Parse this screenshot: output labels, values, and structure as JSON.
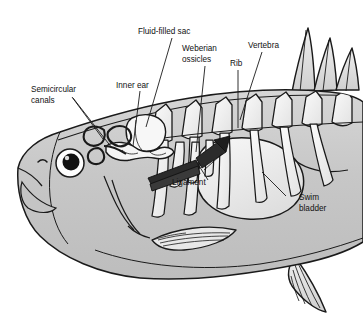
{
  "figure": {
    "background_color": "#ffffff",
    "body_fill": "#c9c9c9",
    "organ_fill": "#f2f2f2",
    "outline_color": "#1a1a1a",
    "ligament_fill": "#2b2b2b"
  },
  "labels": {
    "semicircular_canals_line1": "Semicircular",
    "semicircular_canals_line2": "canals",
    "inner_ear": "Inner ear",
    "fluid_filled_sac": "Fluid-filled sac",
    "weberian_ossicles_line1": "Weberian",
    "weberian_ossicles_line2": "ossicles",
    "rib": "Rib",
    "vertebra": "Vertebra",
    "ligament": "Ligament",
    "swim_bladder_line1": "Swim",
    "swim_bladder_line2": "bladder"
  },
  "parts": {
    "body": "fish-body",
    "eye": "eye",
    "pupil": "pupil",
    "nostril": "nostril",
    "mouth": "mouth",
    "operculum": "gill-cover",
    "pectoral_fin": "pectoral-fin",
    "pelvic_fin": "pelvic-fin",
    "dorsal_fin": "dorsal-fin",
    "vertebral_column": "vertebral-column",
    "ribs": "ribs",
    "swim_bladder": "swim-bladder",
    "ligament": "ligament",
    "weberian_ossicles": "weberian-ossicles",
    "fluid_filled_sac": "fluid-filled-sac",
    "inner_ear": "inner-ear",
    "semicircular_canals": "semicircular-canals"
  }
}
